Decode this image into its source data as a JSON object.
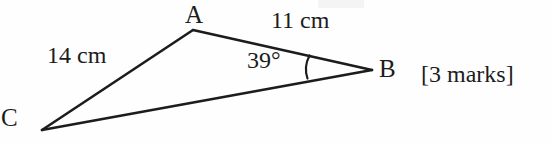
{
  "figure": {
    "type": "triangle-diagram",
    "stroke_color": "#1c1c1c",
    "background_color": "#fefefe",
    "vertices": [
      {
        "name": "A",
        "label": "A",
        "x": 193,
        "y": 30
      },
      {
        "name": "B",
        "label": "B",
        "x": 372,
        "y": 70
      },
      {
        "name": "C",
        "label": "C",
        "x": 42,
        "y": 130
      }
    ],
    "sides": [
      {
        "name": "CA",
        "from": "C",
        "to": "A",
        "label": "14 cm",
        "value": 14,
        "unit": "cm"
      },
      {
        "name": "AB",
        "from": "A",
        "to": "B",
        "label": "11 cm",
        "value": 11,
        "unit": "cm"
      },
      {
        "name": "CB",
        "from": "C",
        "to": "B",
        "label": "",
        "value": null,
        "unit": ""
      }
    ],
    "angles": [
      {
        "at": "B",
        "label": "39°",
        "value": 39,
        "unit": "degrees",
        "arc": true
      }
    ]
  },
  "annotations": {
    "marks": "[3 marks]"
  }
}
